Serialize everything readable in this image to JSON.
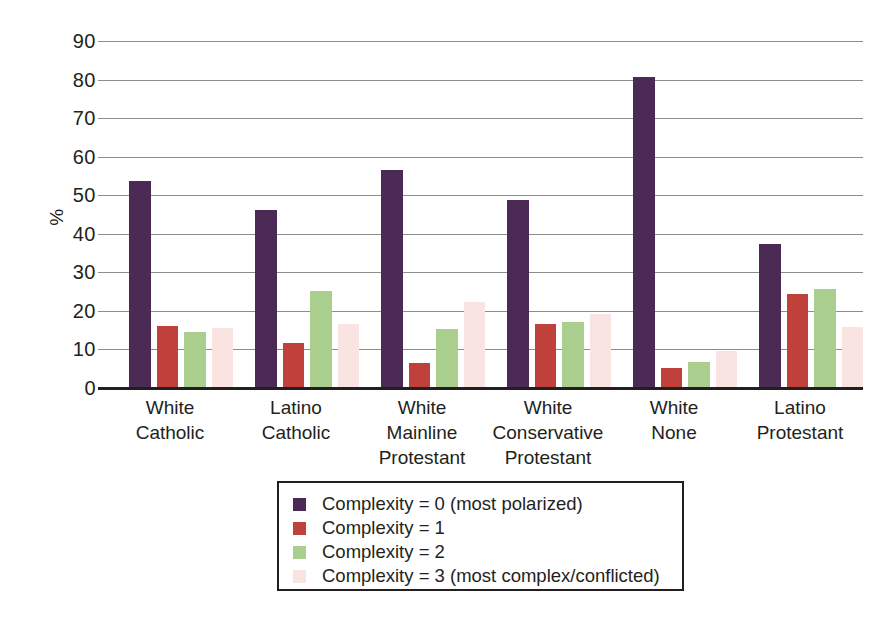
{
  "chart_data": {
    "type": "bar",
    "title": "",
    "xlabel": "",
    "ylabel": "%",
    "ylim": [
      0,
      90
    ],
    "yticks": [
      0,
      10,
      20,
      30,
      40,
      50,
      60,
      70,
      80,
      90
    ],
    "ytick_labels": [
      "0",
      "10",
      "20",
      "30",
      "40",
      "50",
      "60",
      "70",
      "80",
      "90"
    ],
    "grid": true,
    "legend_position": "bottom-center",
    "categories": [
      "White\nCatholic",
      "Latino\nCatholic",
      "White Mainline\nProtestant",
      "White\nConservative\nProtestant",
      "White\nNone",
      "Latino\nProtestant"
    ],
    "category_lines": [
      [
        "White",
        "Catholic"
      ],
      [
        "Latino",
        "Catholic"
      ],
      [
        "White Mainline",
        "Protestant"
      ],
      [
        "White",
        "Conservative",
        "Protestant"
      ],
      [
        "White",
        "None"
      ],
      [
        "Latino",
        "Protestant"
      ]
    ],
    "series": [
      {
        "name": "Complexity = 0 (most polarized)",
        "color": "#4c2a56",
        "values": [
          53.8,
          46.1,
          56.6,
          48.8,
          80.7,
          37.4
        ]
      },
      {
        "name": "Complexity = 1",
        "color": "#c0403c",
        "values": [
          16.0,
          11.8,
          6.4,
          16.6,
          5.3,
          24.4
        ]
      },
      {
        "name": "Complexity = 2",
        "color": "#a9ce8e",
        "values": [
          14.4,
          25.2,
          15.3,
          17.0,
          6.8,
          25.8
        ]
      },
      {
        "name": "Complexity = 3 (most complex/conflicted)",
        "color": "#fae4e2",
        "values": [
          15.5,
          16.6,
          22.3,
          19.2,
          9.5,
          15.8
        ]
      }
    ]
  },
  "legend": {
    "items": [
      {
        "label": "Complexity = 0 (most polarized)",
        "color": "#4c2a56"
      },
      {
        "label": "Complexity = 1",
        "color": "#c0403c"
      },
      {
        "label": "Complexity = 2",
        "color": "#a9ce8e"
      },
      {
        "label": "Complexity = 3 (most complex/conflicted)",
        "color": "#fae4e2"
      }
    ]
  },
  "colors": {
    "axis": "#231f20",
    "gridline": "#8d8d8d",
    "background": "#ffffff",
    "series_0": "#4c2a56",
    "series_1": "#c0403c",
    "series_2": "#a9ce8e",
    "series_3": "#fae4e2"
  }
}
